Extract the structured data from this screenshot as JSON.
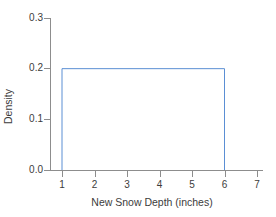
{
  "figure": {
    "top_crop_sliver_text": "............",
    "background_color": "#ffffff"
  },
  "chart_data": {
    "type": "line",
    "title": "",
    "subtitle": "",
    "xlabel": "New Snow Depth (inches)",
    "ylabel": "Density",
    "xlim": [
      0.6,
      7.4
    ],
    "ylim": [
      0.0,
      0.32
    ],
    "xticks": [
      1,
      2,
      3,
      4,
      5,
      6,
      7
    ],
    "xtick_labels": [
      "1",
      "2",
      "3",
      "4",
      "5",
      "6",
      "7"
    ],
    "yticks": [
      0.0,
      0.1,
      0.2,
      0.3
    ],
    "ytick_labels": [
      "0.0",
      "0.1",
      "0.2",
      "0.3"
    ],
    "grid": false,
    "legend": "none",
    "annotations": [],
    "series": [
      {
        "name": "Uniform(1, 6) density",
        "color": "#5b8fd4",
        "line_width": 1,
        "distribution": "uniform",
        "lower_bound": 1,
        "upper_bound": 6,
        "density_height": 0.2,
        "x": [
          1,
          1,
          6,
          6
        ],
        "y": [
          0.0,
          0.2,
          0.2,
          0.0
        ]
      }
    ]
  },
  "colors": {
    "line": "#5b8fd4",
    "axis": "#8d8d8d",
    "text": "#3c3c3c",
    "background": "#ffffff"
  }
}
